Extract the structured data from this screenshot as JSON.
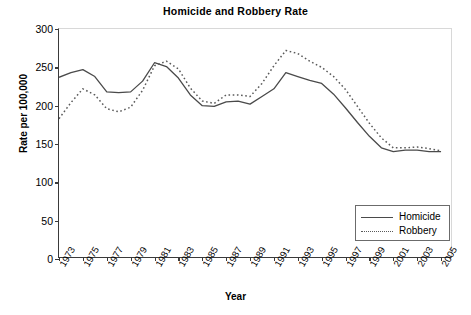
{
  "chart_data": {
    "type": "line",
    "title": "Homicide and Robbery Rate",
    "xlabel": "Year",
    "ylabel": "Rate per 100,000",
    "grid": false,
    "legend_position": "bottom-right",
    "xlim": [
      1973,
      2006
    ],
    "ylim": [
      0,
      300
    ],
    "ytick_labels": [
      "0",
      "50",
      "100",
      "150",
      "200",
      "250",
      "300"
    ],
    "ytick_values": [
      0,
      50,
      100,
      150,
      200,
      250,
      300
    ],
    "xtick_labels": [
      "1973",
      "1975",
      "1977",
      "1979",
      "1981",
      "1983",
      "1985",
      "1987",
      "1989",
      "1991",
      "1993",
      "1995",
      "1997",
      "1999",
      "2001",
      "2003",
      "2005"
    ],
    "xtick_values": [
      1973,
      1975,
      1977,
      1979,
      1981,
      1983,
      1985,
      1987,
      1989,
      1991,
      1993,
      1995,
      1997,
      1999,
      2001,
      2003,
      2005
    ],
    "x": [
      1973,
      1974,
      1975,
      1976,
      1977,
      1978,
      1979,
      1980,
      1981,
      1982,
      1983,
      1984,
      1985,
      1986,
      1987,
      1988,
      1989,
      1990,
      1991,
      1992,
      1993,
      1994,
      1995,
      1996,
      1997,
      1998,
      1999,
      2000,
      2001,
      2002,
      2003,
      2004,
      2005
    ],
    "series": [
      {
        "name": "Homicide",
        "style": "solid",
        "color": "#4a4a4a",
        "values": [
          237,
          243,
          247,
          238,
          218,
          217,
          218,
          232,
          256,
          251,
          236,
          214,
          200,
          199,
          205,
          206,
          202,
          212,
          222,
          243,
          238,
          233,
          229,
          215,
          197,
          178,
          160,
          145,
          140,
          142,
          142,
          140,
          140
        ]
      },
      {
        "name": "Robbery",
        "style": "dotted",
        "color": "#5a5a5a",
        "values": [
          183,
          204,
          222,
          214,
          196,
          192,
          198,
          220,
          252,
          258,
          248,
          223,
          206,
          203,
          214,
          214,
          212,
          229,
          252,
          272,
          268,
          258,
          250,
          238,
          221,
          199,
          177,
          158,
          145,
          145,
          146,
          144,
          141
        ]
      }
    ]
  },
  "legend": {
    "items": [
      {
        "label": "Homicide"
      },
      {
        "label": "Robbery"
      }
    ]
  }
}
